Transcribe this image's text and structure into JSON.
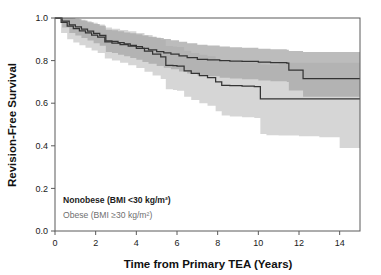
{
  "chart_data": {
    "type": "line",
    "title": "",
    "subtitle": "",
    "xlabel": "Time from Primary TEA (Years)",
    "ylabel": "Revision-Free Survival",
    "xlim": [
      0,
      15
    ],
    "ylim": [
      0.0,
      1.0
    ],
    "xticks": [
      0,
      2,
      4,
      6,
      8,
      10,
      12,
      14
    ],
    "xticklabels": [
      "0",
      "2",
      "4",
      "6",
      "8",
      "10",
      "12",
      "14"
    ],
    "yticks": [
      0.0,
      0.2,
      0.4,
      0.6,
      0.8,
      1.0
    ],
    "yticklabels": [
      "0.0",
      "0.2",
      "0.4",
      "0.6",
      "0.8",
      "1.0"
    ],
    "grid": false,
    "legend_position": "lower-left-inside",
    "annotations": [
      "Nonobese (BMI <30 kg/m²)",
      "Obese (BMI ≥30 kg/m²)"
    ],
    "series": [
      {
        "name": "Nonobese (BMI <30 kg/m²)",
        "color": "#3a3a3a",
        "style": "step-post",
        "band_color": "#a8a8a8",
        "x": [
          0,
          0.35,
          0.7,
          1.0,
          1.3,
          1.6,
          1.9,
          2.2,
          2.5,
          2.8,
          3.1,
          3.4,
          3.7,
          4.0,
          4.3,
          4.6,
          5.0,
          5.35,
          5.7,
          6.1,
          6.5,
          7.0,
          7.5,
          8.1,
          8.6,
          9.2,
          10.0,
          10.6,
          11.4,
          11.5,
          12.2,
          13.0,
          14.0,
          15.0
        ],
        "y": [
          1.0,
          0.985,
          0.968,
          0.958,
          0.948,
          0.938,
          0.928,
          0.918,
          0.893,
          0.89,
          0.885,
          0.878,
          0.872,
          0.866,
          0.858,
          0.85,
          0.842,
          0.836,
          0.83,
          0.822,
          0.814,
          0.806,
          0.804,
          0.8,
          0.798,
          0.796,
          0.793,
          0.79,
          0.788,
          0.755,
          0.715,
          0.715,
          0.715,
          0.715
        ],
        "ci_lower": [
          1.0,
          0.955,
          0.93,
          0.918,
          0.906,
          0.894,
          0.882,
          0.87,
          0.84,
          0.836,
          0.828,
          0.82,
          0.812,
          0.804,
          0.794,
          0.785,
          0.775,
          0.767,
          0.759,
          0.749,
          0.739,
          0.73,
          0.726,
          0.72,
          0.716,
          0.712,
          0.707,
          0.703,
          0.7,
          0.66,
          0.63,
          0.63,
          0.63,
          0.63
        ],
        "ci_upper": [
          1.0,
          1.0,
          1.0,
          0.995,
          0.988,
          0.98,
          0.972,
          0.964,
          0.945,
          0.942,
          0.938,
          0.932,
          0.928,
          0.924,
          0.918,
          0.912,
          0.906,
          0.901,
          0.896,
          0.889,
          0.882,
          0.874,
          0.871,
          0.866,
          0.863,
          0.86,
          0.856,
          0.853,
          0.851,
          0.845,
          0.84,
          0.84,
          0.84,
          0.84
        ]
      },
      {
        "name": "Obese (BMI ≥30 kg/m²)",
        "color": "#3a3a3a",
        "style": "step-post",
        "band_color": "#d2d2d2",
        "x": [
          0,
          0.3,
          0.6,
          0.9,
          1.2,
          1.5,
          1.8,
          2.1,
          2.45,
          2.8,
          3.2,
          3.6,
          4.0,
          4.4,
          4.8,
          5.2,
          5.45,
          5.8,
          6.0,
          6.35,
          6.7,
          7.1,
          7.5,
          7.9,
          8.2,
          8.6,
          9.2,
          9.8,
          10.1,
          10.4,
          11.0,
          12.0,
          13.0,
          14.0,
          15.0
        ],
        "y": [
          1.0,
          0.98,
          0.962,
          0.95,
          0.94,
          0.93,
          0.92,
          0.91,
          0.888,
          0.882,
          0.875,
          0.868,
          0.858,
          0.845,
          0.83,
          0.818,
          0.778,
          0.776,
          0.774,
          0.752,
          0.74,
          0.73,
          0.72,
          0.7,
          0.684,
          0.682,
          0.68,
          0.678,
          0.62,
          0.62,
          0.62,
          0.62,
          0.62,
          0.62,
          0.62
        ],
        "ci_lower": [
          1.0,
          0.93,
          0.9,
          0.885,
          0.872,
          0.86,
          0.848,
          0.836,
          0.81,
          0.8,
          0.79,
          0.778,
          0.765,
          0.748,
          0.73,
          0.714,
          0.665,
          0.662,
          0.658,
          0.63,
          0.615,
          0.6,
          0.588,
          0.562,
          0.542,
          0.538,
          0.534,
          0.53,
          0.455,
          0.45,
          0.448,
          0.445,
          0.44,
          0.39,
          0.39
        ],
        "ci_upper": [
          1.0,
          1.0,
          1.0,
          0.998,
          0.992,
          0.985,
          0.978,
          0.97,
          0.955,
          0.95,
          0.944,
          0.938,
          0.93,
          0.92,
          0.908,
          0.898,
          0.868,
          0.866,
          0.864,
          0.846,
          0.836,
          0.828,
          0.82,
          0.806,
          0.795,
          0.793,
          0.791,
          0.79,
          0.782,
          0.78,
          0.79,
          0.79,
          0.79,
          0.79,
          0.79
        ]
      }
    ]
  },
  "axes": {
    "ylabel": "Revision-Free Survival",
    "xlabel": "Time from Primary TEA (Years)"
  },
  "legend": {
    "nonobese": "Nonobese (BMI <30 kg/m²)",
    "obese": "Obese (BMI ≥30 kg/m²)"
  },
  "colors": {
    "line": "#3a3a3a",
    "band_nonobese": "#a8a8a8",
    "band_obese": "#d2d2d2",
    "frame": "#5a5a5a",
    "text": "#1a1a1a",
    "text_muted": "#6f6f6f"
  }
}
